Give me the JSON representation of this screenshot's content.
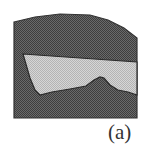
{
  "figure": {
    "panel_label": "(a)",
    "regions": [
      {
        "name": "outer-dark-region",
        "fill": "#555555",
        "texture": "dotted",
        "points": [
          [
            14,
            22
          ],
          [
            35,
            17
          ],
          [
            60,
            14
          ],
          [
            90,
            15
          ],
          [
            108,
            20
          ],
          [
            124,
            28
          ],
          [
            137,
            38
          ],
          [
            137,
            118
          ],
          [
            14,
            118
          ]
        ]
      },
      {
        "name": "inner-light-region",
        "fill": "#c8c8c8",
        "texture": "dotted",
        "points": [
          [
            23,
            54
          ],
          [
            137,
            62
          ],
          [
            137,
            95
          ],
          [
            128,
            92
          ],
          [
            118,
            90
          ],
          [
            110,
            85
          ],
          [
            104,
            78
          ],
          [
            100,
            77
          ],
          [
            94,
            80
          ],
          [
            86,
            86
          ],
          [
            70,
            89
          ],
          [
            52,
            92
          ],
          [
            40,
            95
          ],
          [
            35,
            90
          ],
          [
            30,
            78
          ]
        ]
      }
    ]
  }
}
